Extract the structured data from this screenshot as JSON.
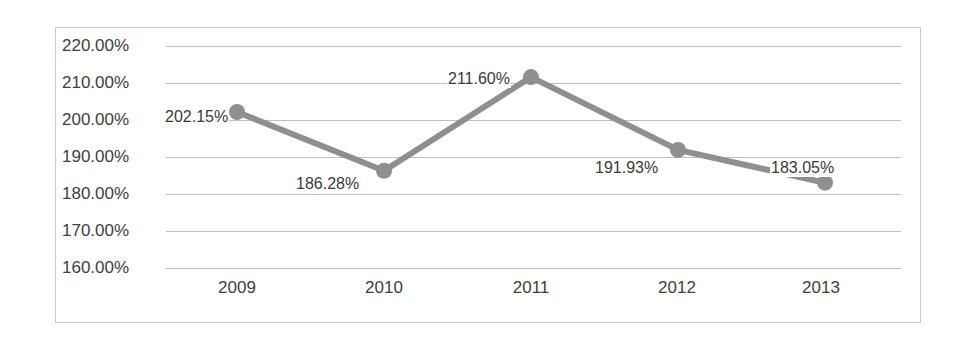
{
  "chart_data": {
    "type": "line",
    "title": "",
    "xlabel": "",
    "ylabel": "",
    "categories": [
      "2009",
      "2010",
      "2011",
      "2012",
      "2013"
    ],
    "values": [
      202.15,
      186.28,
      211.6,
      191.93,
      183.05
    ],
    "value_labels": [
      "202.15%",
      "186.28%",
      "211.60%",
      "191.93%",
      "183.05%"
    ],
    "ylim": [
      160,
      220
    ],
    "ytick_values": [
      220,
      210,
      200,
      190,
      180,
      170,
      160
    ],
    "ytick_labels": [
      "220.00%",
      "210.00%",
      "200.00%",
      "190.00%",
      "180.00%",
      "170.00%",
      "160.00%"
    ],
    "grid": true,
    "legend": false,
    "series_color": "#8f8f8f",
    "marker_color": "#8f8f8f",
    "gridline_color": "#bfbfbf",
    "border_color": "#c8c8c8",
    "text_color": "#404040",
    "label_positions": [
      "above-left",
      "below-left",
      "above-left",
      "below-left",
      "above-right"
    ]
  }
}
